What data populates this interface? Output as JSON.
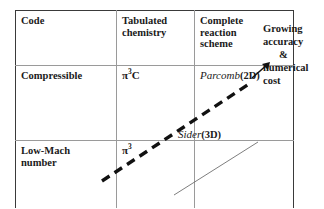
{
  "figure": {
    "table": {
      "columns": [
        {
          "key": "code",
          "header": "Code"
        },
        {
          "key": "tabulated",
          "header_line1": "Tabulated",
          "header_line2": "chemistry"
        },
        {
          "key": "complete",
          "header_line1": "Complete",
          "header_line2": "reaction",
          "header_line3": "scheme"
        }
      ],
      "rows": [
        {
          "label_line1": "Compressible",
          "label_line2": "",
          "tabulated_symbol": "π",
          "tabulated_sup": "3",
          "tabulated_suffix": "C",
          "complete_name": "Parcomb",
          "complete_dims": "(2D)"
        },
        {
          "label_line1": "Low-Mach",
          "label_line2": "number",
          "tabulated_symbol": "π",
          "tabulated_sup": "3",
          "tabulated_suffix": "",
          "complete_name": "",
          "complete_dims": ""
        }
      ],
      "mid_cell_entry": {
        "name": "Sider",
        "dims": "(3D)"
      }
    },
    "side_caption": {
      "line1": "Growing",
      "line2": "accuracy",
      "line3": "&",
      "line4": "numerical",
      "line5": "cost"
    },
    "annotations": {
      "trend_arrow_name": "growing-accuracy-dashed-arrow",
      "small_arrow_name": "growing-accuracy-arrow-icon",
      "diagonal_name": "bottom-right-diagonal-line"
    },
    "colors": {
      "outer_border": "#3a3a3a",
      "inner_border": "#9a9a9a",
      "text": "#1a1a1a",
      "dashed_arrow": "#111111",
      "thin_diagonal": "#6f6f6f"
    }
  }
}
